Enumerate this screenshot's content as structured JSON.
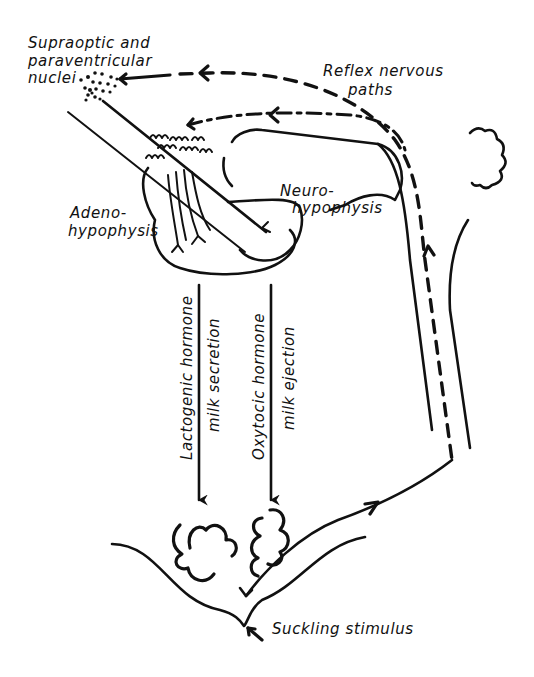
{
  "figure": {
    "background": "#ffffff",
    "ink_color": "#111111"
  },
  "labels": {
    "nuclei_line1": "Supraoptic and",
    "nuclei_line2": "paraventricular",
    "nuclei_line3": "nuclei",
    "reflex_line1": "Reflex nervous",
    "reflex_line2": "paths",
    "neuro_line1": "Neuro-",
    "neuro_line2": "hypophysis",
    "adeno_line1": "Adeno-",
    "adeno_line2": "hypophysis",
    "lactogenic_hormone": "Lactogenic hormone",
    "milk_secretion": "milk secretion",
    "oxytocic_hormone": "Oxytocic hormone",
    "milk_ejection": "milk ejection",
    "suckling_stimulus": "Suckling stimulus"
  },
  "nodes": [
    {
      "id": "nuclei",
      "label": "Supraoptic and paraventricular nuclei"
    },
    {
      "id": "adenohypophysis",
      "label": "Adeno-hypophysis"
    },
    {
      "id": "neurohypophysis",
      "label": "Neuro-hypophysis"
    },
    {
      "id": "mammary_alveoli_left",
      "label": ""
    },
    {
      "id": "mammary_alveoli_right",
      "label": ""
    },
    {
      "id": "nipple",
      "label": "Suckling stimulus"
    },
    {
      "id": "spinal_cord",
      "label": ""
    },
    {
      "id": "brain",
      "label": ""
    }
  ],
  "edges": [
    {
      "from": "nipple",
      "to": "spinal_cord",
      "style": "solid-arrow",
      "label": ""
    },
    {
      "from": "spinal_cord",
      "to": "nuclei",
      "style": "dashed-arrow",
      "label": "Reflex nervous paths"
    },
    {
      "from": "spinal_cord",
      "to": "adenohypophysis",
      "style": "dash-dot-arrow",
      "label": "Reflex nervous paths"
    },
    {
      "from": "adenohypophysis",
      "to": "mammary_alveoli_left",
      "style": "solid-arrow",
      "label": "Lactogenic hormone — milk secretion"
    },
    {
      "from": "neurohypophysis",
      "to": "mammary_alveoli_right",
      "style": "solid-arrow",
      "label": "Oxytocic hormone — milk ejection"
    }
  ]
}
